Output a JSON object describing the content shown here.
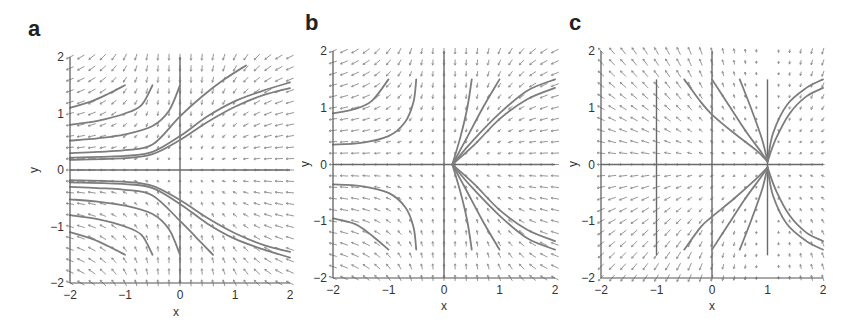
{
  "chart_data": [
    {
      "type": "quiver",
      "panel_label": "a",
      "xlabel": "x",
      "ylabel": "y",
      "xlim": [
        -2,
        2
      ],
      "ylim": [
        -2,
        2
      ],
      "xticks": [
        -2,
        -1,
        0,
        1,
        2
      ],
      "yticks": [
        -2,
        -1,
        0,
        1,
        2
      ],
      "grid": false,
      "pixel_box": {
        "left": 70,
        "top": 57,
        "right": 290,
        "bottom": 283
      },
      "field": {
        "dx": "-x^2",
        "dy": "-y",
        "grid_n": 21
      },
      "reference_lines": [
        {
          "orient": "v",
          "at": 0,
          "from": -2,
          "to": 2
        },
        {
          "orient": "h",
          "at": 0,
          "from": -2,
          "to": 2
        }
      ],
      "trajectories": [
        [
          [
            -2,
            1.1
          ],
          [
            -1.6,
            1.22
          ],
          [
            -1.3,
            1.35
          ],
          [
            -1,
            1.5
          ]
        ],
        [
          [
            -2,
            0.8
          ],
          [
            -1.5,
            0.87
          ],
          [
            -1,
            1.0
          ],
          [
            -0.7,
            1.15
          ],
          [
            -0.5,
            1.5
          ]
        ],
        [
          [
            -2,
            0.52
          ],
          [
            -1.5,
            0.56
          ],
          [
            -1,
            0.63
          ],
          [
            -0.5,
            0.78
          ],
          [
            -0.2,
            1.05
          ],
          [
            0,
            1.5
          ]
        ],
        [
          [
            -2,
            0.3
          ],
          [
            -1.5,
            0.32
          ],
          [
            -1,
            0.35
          ],
          [
            -0.5,
            0.45
          ],
          [
            0,
            0.95
          ],
          [
            0.4,
            1.3
          ],
          [
            0.8,
            1.6
          ],
          [
            1.2,
            1.85
          ]
        ],
        [
          [
            -2,
            0.22
          ],
          [
            -1,
            0.25
          ],
          [
            -0.5,
            0.32
          ],
          [
            0,
            0.6
          ],
          [
            0.5,
            0.95
          ],
          [
            1,
            1.22
          ],
          [
            1.5,
            1.4
          ],
          [
            2,
            1.55
          ]
        ],
        [
          [
            -2,
            0.18
          ],
          [
            -1,
            0.21
          ],
          [
            -0.5,
            0.28
          ],
          [
            0,
            0.53
          ],
          [
            0.5,
            0.85
          ],
          [
            1,
            1.12
          ],
          [
            1.5,
            1.32
          ],
          [
            2,
            1.45
          ]
        ],
        [
          [
            -2,
            -0.18
          ],
          [
            -1,
            -0.21
          ],
          [
            -0.5,
            -0.28
          ],
          [
            0,
            -0.53
          ],
          [
            0.5,
            -0.85
          ],
          [
            1,
            -1.12
          ],
          [
            1.5,
            -1.32
          ],
          [
            2,
            -1.45
          ]
        ],
        [
          [
            -2,
            -0.22
          ],
          [
            -1,
            -0.25
          ],
          [
            -0.5,
            -0.32
          ],
          [
            0,
            -0.6
          ],
          [
            0.5,
            -0.95
          ],
          [
            1,
            -1.22
          ],
          [
            1.5,
            -1.4
          ],
          [
            2,
            -1.55
          ]
        ],
        [
          [
            -2,
            -0.3
          ],
          [
            -1.5,
            -0.32
          ],
          [
            -1,
            -0.35
          ],
          [
            -0.5,
            -0.45
          ],
          [
            0,
            -0.9
          ],
          [
            0.3,
            -1.2
          ],
          [
            0.6,
            -1.5
          ]
        ],
        [
          [
            -2,
            -0.52
          ],
          [
            -1.5,
            -0.56
          ],
          [
            -1,
            -0.63
          ],
          [
            -0.5,
            -0.78
          ],
          [
            -0.2,
            -1.05
          ],
          [
            0,
            -1.5
          ]
        ],
        [
          [
            -2,
            -0.8
          ],
          [
            -1.5,
            -0.87
          ],
          [
            -1,
            -1.0
          ],
          [
            -0.7,
            -1.15
          ],
          [
            -0.5,
            -1.5
          ]
        ],
        [
          [
            -2,
            -1.1
          ],
          [
            -1.6,
            -1.22
          ],
          [
            -1.3,
            -1.35
          ],
          [
            -1,
            -1.5
          ]
        ]
      ]
    },
    {
      "type": "quiver",
      "panel_label": "b",
      "xlabel": "x",
      "ylabel": "y",
      "xlim": [
        -2,
        2
      ],
      "ylim": [
        -2,
        2
      ],
      "xticks": [
        -2,
        -1,
        0,
        1,
        2
      ],
      "yticks": [
        -2,
        -1,
        0,
        1,
        2
      ],
      "grid": false,
      "pixel_box": {
        "left": 333,
        "top": 51,
        "right": 555,
        "bottom": 278
      },
      "field": {
        "dx": "-x^2",
        "dy": "-y",
        "grid_n": 21
      },
      "fixed_point": [
        0.15,
        0
      ],
      "reference_lines": [
        {
          "orient": "v",
          "at": 0,
          "from": -2,
          "to": 2
        },
        {
          "orient": "h",
          "at": 0,
          "from": -2,
          "to": 2
        }
      ],
      "trajectories": [
        [
          [
            -2,
            0.9
          ],
          [
            -1.6,
            0.98
          ],
          [
            -1.3,
            1.12
          ],
          [
            -1,
            1.5
          ]
        ],
        [
          [
            -2,
            0.35
          ],
          [
            -1.5,
            0.38
          ],
          [
            -1,
            0.5
          ],
          [
            -0.7,
            0.75
          ],
          [
            -0.55,
            1.1
          ],
          [
            -0.5,
            1.5
          ]
        ],
        [
          [
            -2,
            -0.35
          ],
          [
            -1.5,
            -0.38
          ],
          [
            -1,
            -0.5
          ],
          [
            -0.7,
            -0.75
          ],
          [
            -0.55,
            -1.1
          ],
          [
            -0.5,
            -1.5
          ]
        ],
        [
          [
            -2,
            -0.95
          ],
          [
            -1.6,
            -1.05
          ],
          [
            -1.3,
            -1.25
          ],
          [
            -1,
            -1.5
          ]
        ],
        [
          [
            0.15,
            0
          ],
          [
            0.3,
            0.5
          ],
          [
            0.42,
            1.0
          ],
          [
            0.5,
            1.5
          ]
        ],
        [
          [
            0.15,
            0
          ],
          [
            0.4,
            0.45
          ],
          [
            0.7,
            1.0
          ],
          [
            1.0,
            1.5
          ]
        ],
        [
          [
            0.15,
            0
          ],
          [
            0.5,
            0.4
          ],
          [
            1.0,
            0.9
          ],
          [
            1.5,
            1.3
          ],
          [
            2,
            1.5
          ]
        ],
        [
          [
            0.15,
            0
          ],
          [
            0.55,
            0.35
          ],
          [
            1.0,
            0.8
          ],
          [
            1.5,
            1.15
          ],
          [
            2,
            1.35
          ]
        ],
        [
          [
            0.15,
            0
          ],
          [
            0.3,
            -0.5
          ],
          [
            0.42,
            -1.0
          ],
          [
            0.5,
            -1.5
          ]
        ],
        [
          [
            0.15,
            0
          ],
          [
            0.4,
            -0.45
          ],
          [
            0.7,
            -1.0
          ],
          [
            1.0,
            -1.5
          ]
        ],
        [
          [
            0.15,
            0
          ],
          [
            0.5,
            -0.4
          ],
          [
            1.0,
            -0.9
          ],
          [
            1.5,
            -1.3
          ],
          [
            2,
            -1.5
          ]
        ],
        [
          [
            0.15,
            0
          ],
          [
            0.55,
            -0.35
          ],
          [
            1.0,
            -0.8
          ],
          [
            1.5,
            -1.15
          ],
          [
            2,
            -1.35
          ]
        ]
      ]
    },
    {
      "type": "quiver",
      "panel_label": "c",
      "xlabel": "x",
      "ylabel": "y",
      "xlim": [
        -2,
        2
      ],
      "ylim": [
        -2,
        2
      ],
      "xticks": [
        -2,
        -1,
        0,
        1,
        2
      ],
      "yticks": [
        -2,
        -1,
        0,
        1,
        2
      ],
      "grid": false,
      "pixel_box": {
        "left": 601,
        "top": 51,
        "right": 823,
        "bottom": 278
      },
      "field": {
        "dx": "-(x-1)^2*0.6",
        "dy": "-y*(x-1)",
        "grid_n": 21
      },
      "fixed_point": [
        1,
        0
      ],
      "reference_lines": [
        {
          "orient": "v",
          "at": 0,
          "from": -2,
          "to": 2
        },
        {
          "orient": "h",
          "at": 0,
          "from": -2,
          "to": 2
        },
        {
          "orient": "v",
          "at": -1,
          "from": -1.6,
          "to": 1.5
        },
        {
          "orient": "v",
          "at": 1,
          "from": -1.6,
          "to": 1.5
        }
      ],
      "trajectories": [
        [
          [
            -0.5,
            1.5
          ],
          [
            -0.2,
            1.1
          ],
          [
            0,
            0.88
          ],
          [
            0.4,
            0.55
          ],
          [
            0.8,
            0.25
          ],
          [
            1,
            0.05
          ]
        ],
        [
          [
            0,
            1.5
          ],
          [
            0.3,
            1.05
          ],
          [
            0.6,
            0.6
          ],
          [
            0.9,
            0.2
          ],
          [
            1,
            0.05
          ]
        ],
        [
          [
            0.5,
            1.5
          ],
          [
            0.7,
            1.0
          ],
          [
            0.9,
            0.45
          ],
          [
            1,
            0.05
          ]
        ],
        [
          [
            1,
            0.05
          ],
          [
            1.1,
            0.55
          ],
          [
            1.35,
            1.05
          ],
          [
            1.7,
            1.35
          ],
          [
            2,
            1.5
          ]
        ],
        [
          [
            1,
            0.05
          ],
          [
            1.15,
            0.45
          ],
          [
            1.4,
            0.9
          ],
          [
            1.7,
            1.2
          ],
          [
            2,
            1.35
          ]
        ],
        [
          [
            -0.5,
            -1.5
          ],
          [
            -0.2,
            -1.1
          ],
          [
            0,
            -0.92
          ],
          [
            0.4,
            -0.6
          ],
          [
            0.8,
            -0.25
          ],
          [
            1,
            -0.05
          ]
        ],
        [
          [
            0,
            -1.5
          ],
          [
            0.3,
            -1.05
          ],
          [
            0.6,
            -0.6
          ],
          [
            0.9,
            -0.2
          ],
          [
            1,
            -0.05
          ]
        ],
        [
          [
            0.5,
            -1.5
          ],
          [
            0.7,
            -1.0
          ],
          [
            0.9,
            -0.45
          ],
          [
            1,
            -0.05
          ]
        ],
        [
          [
            1,
            -0.05
          ],
          [
            1.1,
            -0.55
          ],
          [
            1.35,
            -1.05
          ],
          [
            1.7,
            -1.35
          ],
          [
            2,
            -1.5
          ]
        ],
        [
          [
            1,
            -0.05
          ],
          [
            1.15,
            -0.45
          ],
          [
            1.4,
            -0.9
          ],
          [
            1.7,
            -1.2
          ],
          [
            2,
            -1.35
          ]
        ]
      ]
    }
  ],
  "colors": {
    "axis": "#555555",
    "arrow": "#8a8a8a",
    "trajectory": "#7d7d7d",
    "reference_line": "#6a6a6a",
    "text": "#333333"
  }
}
